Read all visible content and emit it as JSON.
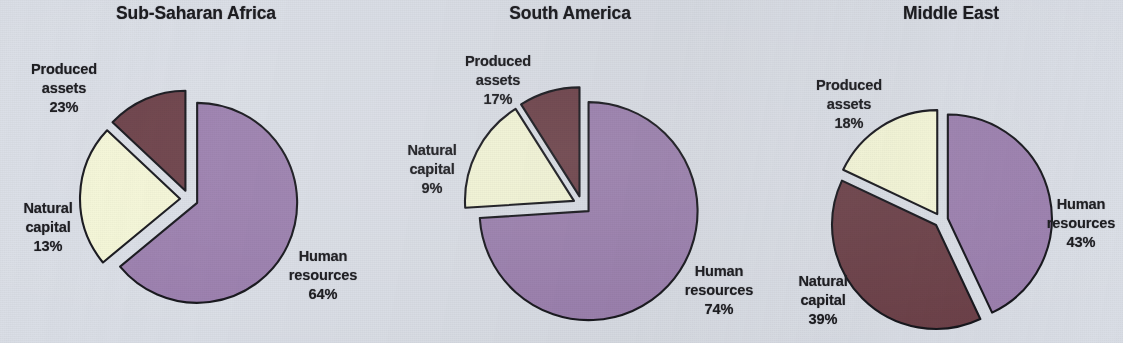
{
  "figure": {
    "background_color": "#dadee6",
    "label_text_color": "#17171b",
    "outline_color": "#14141a"
  },
  "palette": {
    "human_resources": "#9b7fae",
    "natural_capital": "#6b3f47",
    "produced_assets": "#f4f6d7"
  },
  "charts": [
    {
      "title": "Sub-Saharan Africa",
      "labels": {
        "produced": {
          "line1": "Produced",
          "line2": "assets",
          "line3": "23%"
        },
        "natural": {
          "line1": "Natural",
          "line2": "capital",
          "line3": "13%"
        },
        "human": {
          "line1": "Human",
          "line2": "resources",
          "line3": "64%"
        }
      }
    },
    {
      "title": "South America",
      "labels": {
        "produced": {
          "line1": "Produced",
          "line2": "assets",
          "line3": "17%"
        },
        "natural": {
          "line1": "Natural",
          "line2": "capital",
          "line3": "9%"
        },
        "human": {
          "line1": "Human",
          "line2": "resources",
          "line3": "74%"
        }
      }
    },
    {
      "title": "Middle East",
      "labels": {
        "produced": {
          "line1": "Produced",
          "line2": "assets",
          "line3": "18%"
        },
        "natural": {
          "line1": "Natural",
          "line2": "capital",
          "line3": "39%"
        },
        "human": {
          "line1": "Human",
          "line2": "resources",
          "line3": "43%"
        }
      }
    }
  ],
  "chart_data": [
    {
      "type": "pie",
      "title": "Sub-Saharan Africa",
      "categories": [
        "Human resources",
        "Produced assets",
        "Natural capital"
      ],
      "values": [
        64,
        23,
        13
      ],
      "unit": "percent",
      "colors": [
        "#9b7fae",
        "#f4f6d7",
        "#6b3f47"
      ],
      "start_angle_deg": 0,
      "direction": "clockwise",
      "exploded": [
        "Human resources",
        "Produced assets",
        "Natural capital"
      ],
      "legend": "none (direct slice labels)",
      "xlabel": "",
      "ylabel": ""
    },
    {
      "type": "pie",
      "title": "South America",
      "categories": [
        "Human resources",
        "Produced assets",
        "Natural capital"
      ],
      "values": [
        74,
        17,
        9
      ],
      "unit": "percent",
      "colors": [
        "#9b7fae",
        "#f4f6d7",
        "#6b3f47"
      ],
      "start_angle_deg": 0,
      "direction": "clockwise",
      "exploded": [
        "Human resources",
        "Produced assets",
        "Natural capital"
      ],
      "legend": "none (direct slice labels)",
      "xlabel": "",
      "ylabel": ""
    },
    {
      "type": "pie",
      "title": "Middle East",
      "categories": [
        "Human resources",
        "Natural capital",
        "Produced assets"
      ],
      "values": [
        43,
        39,
        18
      ],
      "unit": "percent",
      "colors": [
        "#9b7fae",
        "#6b3f47",
        "#f4f6d7"
      ],
      "start_angle_deg": 0,
      "direction": "clockwise",
      "exploded": [
        "Human resources",
        "Natural capital",
        "Produced assets"
      ],
      "legend": "none (direct slice labels)",
      "xlabel": "",
      "ylabel": ""
    }
  ]
}
